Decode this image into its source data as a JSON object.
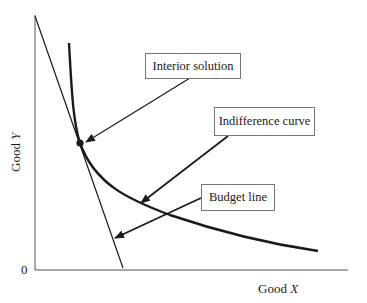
{
  "diagram": {
    "type": "consumer-choice",
    "axes": {
      "x_label_prefix": "Good ",
      "x_label_var": "X",
      "y_label_prefix": "Good ",
      "y_label_var": "Y",
      "origin": "0"
    },
    "annotations": [
      {
        "id": "interior-solution",
        "text": "Interior solution"
      },
      {
        "id": "indifference-curve",
        "text": "Indifference curve"
      },
      {
        "id": "budget-line",
        "text": "Budget line"
      }
    ],
    "colors": {
      "line": "#1a1a1a",
      "box_border": "#777777",
      "background": "#ffffff"
    }
  }
}
